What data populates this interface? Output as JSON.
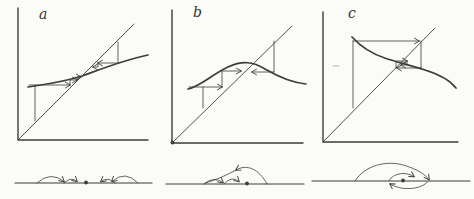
{
  "figure": {
    "width": 474,
    "height": 199,
    "background_color": "#fbfbf8",
    "ink_color": "#3d3d3d"
  },
  "panels": [
    {
      "label": "a"
    },
    {
      "label": "b"
    },
    {
      "label": "c"
    }
  ],
  "diagram": {
    "elements": [
      {
        "name": "a-axes",
        "type": "path",
        "d": "M18,8 L18,140 L148,140",
        "w": 1.4
      },
      {
        "name": "a-diagonal",
        "type": "path",
        "d": "M18,140 L134,24",
        "w": 0.9
      },
      {
        "name": "a-curve",
        "type": "path",
        "d": "M28,87 C40,85 60,83 82,76 C104,68 124,60 148,55",
        "w": 1.7
      },
      {
        "name": "a-cobweb-start-vertical",
        "type": "path",
        "d": "M35,121 L35,85",
        "w": 0.8
      },
      {
        "name": "a-cobweb-step1",
        "type": "path",
        "d": "M29,85 L70,85",
        "w": 0.8,
        "arrow": true
      },
      {
        "name": "a-cobweb-step2",
        "type": "path",
        "d": "M70,85 L70,80 L77,80",
        "w": 0.8,
        "arrow": true
      },
      {
        "name": "a-cobweb-step3",
        "type": "path",
        "d": "M77,80 L77,77 L81,77",
        "w": 0.8,
        "arrow": true
      },
      {
        "name": "a-cobweb-right-drop",
        "type": "path",
        "d": "M118,42 L118,63",
        "w": 0.8
      },
      {
        "name": "a-cobweb-right-step1",
        "type": "path",
        "d": "M118,63 L98,63",
        "w": 0.8,
        "arrow": true
      },
      {
        "name": "a-cobweb-right-step2",
        "type": "path",
        "d": "M98,63 L98,67 L93,67",
        "w": 0.8,
        "arrow": true
      },
      {
        "name": "b-axes",
        "type": "path",
        "d": "M172,10 L172,143 L303,143",
        "w": 1.4
      },
      {
        "name": "b-origin-dot",
        "type": "dot",
        "cx": 172.5,
        "cy": 142.5,
        "r": 2
      },
      {
        "name": "b-diagonal",
        "type": "path",
        "d": "M172,143 L292,26",
        "w": 0.9
      },
      {
        "name": "b-curve",
        "type": "path",
        "d": "M188,89 C201,86 211,75 228,67 C242,60.5 253,61.5 265,69 C277,76 291,82.5 306,84",
        "w": 1.7
      },
      {
        "name": "b-cobweb-start-vertical",
        "type": "path",
        "d": "M203,108 L203,87",
        "w": 0.8
      },
      {
        "name": "b-cobweb-step1",
        "type": "path",
        "d": "M189,87 L222,87",
        "w": 0.8,
        "arrow": true
      },
      {
        "name": "b-cobweb-step2",
        "type": "path",
        "d": "M222,87 L222,71 L241,71",
        "w": 0.8,
        "arrow": true
      },
      {
        "name": "b-cobweb-right-drop",
        "type": "path",
        "d": "M274,41 L274,72",
        "w": 0.8
      },
      {
        "name": "b-cobweb-right-step",
        "type": "path",
        "d": "M274,72 L252,72",
        "w": 0.8,
        "arrow": true
      },
      {
        "name": "c-axes",
        "type": "path",
        "d": "M323,12 L323,142 L458,142",
        "w": 1.4
      },
      {
        "name": "c-diagonal",
        "type": "path",
        "d": "M323,142 L435,28",
        "w": 0.9
      },
      {
        "name": "c-curve",
        "type": "path",
        "d": "M352,37 C361,47 372,54 386,58.5 C399,62.5 411,65.5 425,70 C438,74 449,79 456,88",
        "w": 1.7
      },
      {
        "name": "c-cobweb-start-vertical",
        "type": "path",
        "d": "M353,41 L353,108",
        "w": 0.8
      },
      {
        "name": "c-cobweb-top",
        "type": "path",
        "d": "M353,41 L419,41",
        "w": 0.8,
        "arrow": true
      },
      {
        "name": "c-cobweb-right-drop",
        "type": "path",
        "d": "M421,41 L421,68",
        "w": 0.8
      },
      {
        "name": "c-cobweb-step1",
        "type": "path",
        "d": "M421,68 L397,68",
        "w": 0.8,
        "arrow": true
      },
      {
        "name": "c-cobweb-step2",
        "type": "path",
        "d": "M396,68 L396,61 L407,61",
        "w": 0.8,
        "arrow": true
      },
      {
        "name": "c-cobweb-step3",
        "type": "path",
        "d": "M407,61 L407,65 L401,65",
        "w": 0.8,
        "arrow": true
      },
      {
        "name": "c-stray-mark",
        "type": "path",
        "d": "M333,66 L339,66",
        "w": 0.8,
        "o": 0.45
      },
      {
        "name": "phase-a-line",
        "type": "path",
        "d": "M15,183 L152,183",
        "w": 1.2
      },
      {
        "name": "phase-a-fixed-point-dot",
        "type": "dot",
        "cx": 86,
        "cy": 182.5,
        "r": 1.9
      },
      {
        "name": "phase-a-arc1",
        "type": "path",
        "d": "M37,183 Q51,170.5 64,181.5",
        "w": 0.8,
        "arrow": true
      },
      {
        "name": "phase-a-arc2",
        "type": "path",
        "d": "M64,183 Q71,176 77,181.5",
        "w": 0.8,
        "arrow": true
      },
      {
        "name": "phase-a-arc3",
        "type": "path",
        "d": "M115,183 Q108,176 101,181.5",
        "w": 0.8,
        "arrow": true
      },
      {
        "name": "phase-a-arc4",
        "type": "path",
        "d": "M138,183 Q125,169.5 112,181.5",
        "w": 0.8,
        "arrow": true
      },
      {
        "name": "phase-b-line",
        "type": "path",
        "d": "M166,184 L304,184",
        "w": 1.2
      },
      {
        "name": "phase-b-fixed-point-dot",
        "type": "dot",
        "cx": 247,
        "cy": 183.5,
        "r": 1.9
      },
      {
        "name": "phase-b-arc1",
        "type": "path",
        "d": "M204,184 Q214,175.5 223,182.5",
        "w": 0.8,
        "arrow": true
      },
      {
        "name": "phase-b-arc2",
        "type": "path",
        "d": "M224,184 Q232,175 239,181.5",
        "w": 0.8,
        "arrow": true
      },
      {
        "name": "phase-b-big-arc-in",
        "type": "path",
        "d": "M267,184 C259,169 247,163.5 236,170",
        "w": 0.8,
        "arrow": true
      },
      {
        "name": "phase-b-big-arc-out",
        "type": "path",
        "d": "M236,170 C228,174.5 215,180.5 205,183",
        "w": 0.8
      },
      {
        "name": "phase-c-line",
        "type": "path",
        "d": "M312,181 L470,181",
        "w": 1.2
      },
      {
        "name": "phase-c-fixed-point-dot",
        "type": "dot",
        "cx": 403,
        "cy": 180.5,
        "r": 1.9
      },
      {
        "name": "phase-c-arc1",
        "type": "path",
        "d": "M355,181 C364,166 386,159.5 405,165.5 C417,169.5 425,174 429,179.5",
        "w": 0.8,
        "arrow": true
      },
      {
        "name": "phase-c-arc2",
        "type": "path",
        "d": "M428,181.5 C421,190 401,191 390,184",
        "w": 0.8,
        "arrow": true
      },
      {
        "name": "phase-c-arc3",
        "type": "path",
        "d": "M389,180.5 C394,172.5 406,171.5 414,176.5",
        "w": 0.8,
        "arrow": true
      }
    ]
  }
}
